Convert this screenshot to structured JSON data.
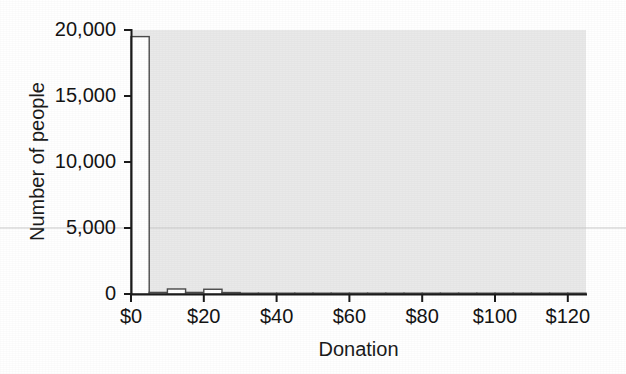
{
  "chart_data": {
    "type": "bar",
    "title": "",
    "subtitle": "",
    "xlabel": "Donation",
    "ylabel": "Number of people",
    "xlim": [
      0,
      125
    ],
    "ylim": [
      0,
      20000
    ],
    "grid": false,
    "legend": null,
    "bin_width": 5,
    "x_tick_labels": [
      "$0",
      "$20",
      "$40",
      "$60",
      "$80",
      "$100",
      "$120"
    ],
    "x_tick_values": [
      0,
      20,
      40,
      60,
      80,
      100,
      120
    ],
    "y_tick_labels": [
      "0",
      "5,000",
      "10,000",
      "15,000",
      "20,000"
    ],
    "y_tick_values": [
      0,
      5000,
      10000,
      15000,
      20000
    ],
    "categories": [
      "$0–$5",
      "$5–$10",
      "$10–$15",
      "$15–$20",
      "$20–$25",
      "$25–$30",
      "$30–$35",
      "$35–$40",
      "$40–$45",
      "$45–$50",
      "$50–$55",
      "$55–$60",
      "$60–$65",
      "$65–$70",
      "$70–$75",
      "$75–$80",
      "$80–$85",
      "$85–$90",
      "$90–$95",
      "$95–$100",
      "$100–$105",
      "$105–$110",
      "$110–$115",
      "$115–$120",
      "$120–$125"
    ],
    "bin_starts": [
      0,
      5,
      10,
      15,
      20,
      25,
      30,
      35,
      40,
      45,
      50,
      55,
      60,
      65,
      70,
      75,
      80,
      85,
      90,
      95,
      100,
      105,
      110,
      115,
      120
    ],
    "values": [
      19500,
      120,
      380,
      120,
      360,
      110,
      60,
      40,
      40,
      30,
      30,
      20,
      20,
      20,
      15,
      15,
      15,
      10,
      10,
      10,
      10,
      10,
      10,
      10,
      10
    ],
    "annotations": [
      {
        "name": "faint-rule-at-5000",
        "y": 5000,
        "description": "faint horizontal scan line across the figure at about 5,000"
      }
    ]
  },
  "style": {
    "plot_background": "#e9e9e9",
    "bar_fill": "#ffffff",
    "bar_edge": "#4a4a4a",
    "axis_color": "#1b1b1b",
    "text_color": "#141414",
    "page_background": "#ffffff"
  }
}
